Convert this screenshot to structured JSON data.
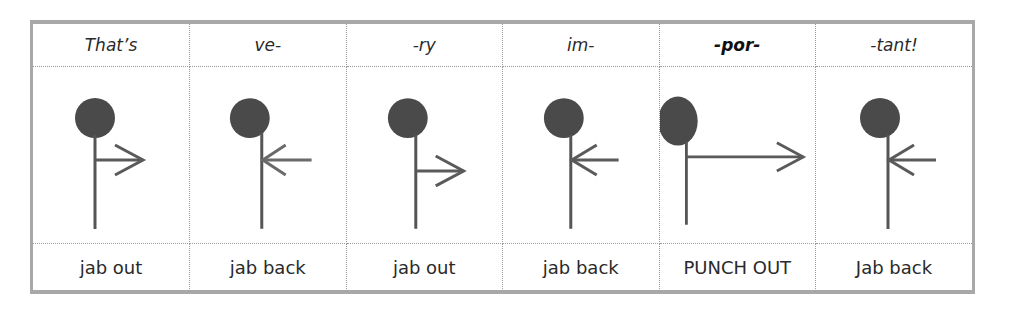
{
  "diagram": {
    "colors": {
      "figure": "#4a4a4a",
      "arrow": "#5a5a5a",
      "grid": "#9a9a9a",
      "frame": "#a8a8a8"
    },
    "columns": [
      {
        "syllable": "That’s",
        "emphasis": false,
        "action": "jab out",
        "arrow": "out",
        "strength": "jab"
      },
      {
        "syllable": "ve-",
        "emphasis": false,
        "action": "jab back",
        "arrow": "back",
        "strength": "jab"
      },
      {
        "syllable": "-ry",
        "emphasis": false,
        "action": "jab out",
        "arrow": "out",
        "strength": "jab"
      },
      {
        "syllable": "im-",
        "emphasis": false,
        "action": "jab back",
        "arrow": "back",
        "strength": "jab"
      },
      {
        "syllable": "-por-",
        "emphasis": true,
        "action": "PUNCH OUT",
        "arrow": "out",
        "strength": "punch"
      },
      {
        "syllable": "-tant!",
        "emphasis": false,
        "action": "Jab back",
        "arrow": "back",
        "strength": "jab"
      }
    ]
  }
}
